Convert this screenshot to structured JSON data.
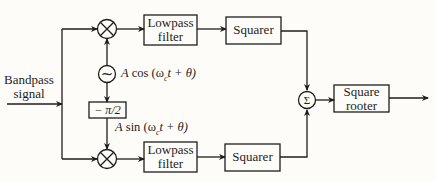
{
  "diagram": {
    "input_label_line1": "Bandpass",
    "input_label_line2": "signal",
    "top_branch": {
      "mixer_symbol": "⊗",
      "lowpass_line1": "Lowpass",
      "lowpass_line2": "filter",
      "squarer": "Squarer"
    },
    "bottom_branch": {
      "mixer_symbol": "⊗",
      "lowpass_line1": "Lowpass",
      "lowpass_line2": "filter",
      "squarer": "Squarer"
    },
    "oscillator": {
      "symbol": "~",
      "amp": "A",
      "func": "cos",
      "arg": "(ω",
      "sub": "c",
      "rest": "t + θ)"
    },
    "phase_shift": "− π/2",
    "shifted_signal": {
      "amp": "A",
      "func": "sin",
      "arg": "(ω",
      "sub": "c",
      "rest": "t + θ)"
    },
    "summer_symbol": "Σ",
    "rooter_line1": "Square",
    "rooter_line2": "rooter"
  },
  "colors": {
    "line": "#1e1e1e",
    "background": "#fdfcf8"
  }
}
